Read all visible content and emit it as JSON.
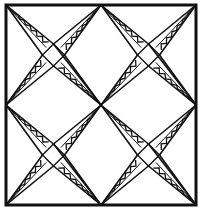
{
  "title": "Quilt block line drawing",
  "colors": {
    "ink": "#111111",
    "paper": "#ffffff"
  },
  "frame": {
    "left": 6,
    "top": 5,
    "right": 196,
    "bottom": 205,
    "stroke_width": 3
  },
  "pattern": {
    "description": "Four quadrants, each with an X of two crossing kite-shaped arms forming a small tilted square at the quadrant center; each arm half has a zigzag fill",
    "quadrants": [
      {
        "name": "top-left",
        "x0": 6,
        "y0": 5,
        "x1": 101,
        "y1": 105
      },
      {
        "name": "top-right",
        "x0": 101,
        "y0": 5,
        "x1": 196,
        "y1": 105
      },
      {
        "name": "bottom-left",
        "x0": 6,
        "y0": 105,
        "x1": 101,
        "y1": 205
      },
      {
        "name": "bottom-right",
        "x0": 101,
        "y0": 105,
        "x1": 196,
        "y1": 205
      }
    ],
    "kite_half_width": 11,
    "zigzag_teeth": 6
  }
}
